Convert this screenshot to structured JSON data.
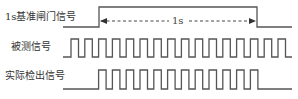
{
  "diagram": {
    "title": "",
    "stroke_color": "#555555",
    "text_color": "#333333",
    "signals": [
      {
        "id": "gate",
        "label": "1s基准闸门信号",
        "label_pos": {
          "x": 5,
          "y": 11
        },
        "high_y": 7,
        "low_y": 27,
        "x_start": 63,
        "x_end": 292,
        "rise_x": 99,
        "fall_x": 257
      },
      {
        "id": "measured",
        "label": "被测信号",
        "label_pos": {
          "x": 11,
          "y": 41
        },
        "high_y": 39,
        "low_y": 57,
        "x_start": 63,
        "x_end": 292,
        "first_rise_x": 71,
        "period": 13.8,
        "high_width": 7.5,
        "pulse_count": 16
      },
      {
        "id": "detected",
        "label": "实际检出信号",
        "label_pos": {
          "x": 5,
          "y": 70
        },
        "high_y": 70,
        "low_y": 89,
        "x_start": 63,
        "x_end": 292,
        "first_rise_x": 98.6,
        "period": 13.8,
        "high_width": 7.5,
        "pulse_count": 12
      }
    ],
    "interval_arrow": {
      "label": "1s",
      "y": 21,
      "x_start": 101,
      "x_end": 255,
      "style": "dashed",
      "heads": "both"
    }
  }
}
